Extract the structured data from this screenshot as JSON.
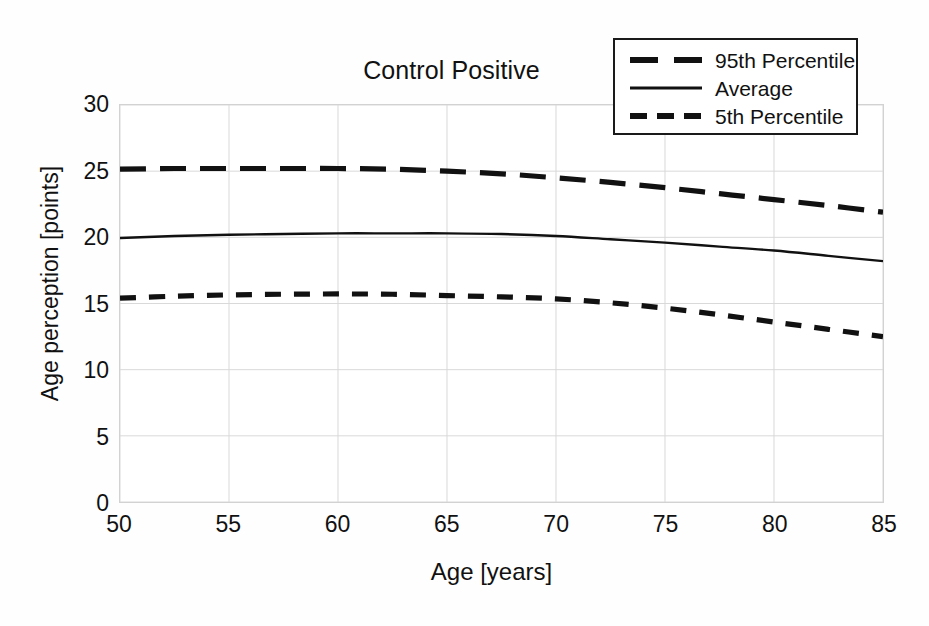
{
  "chart_data": {
    "type": "line",
    "title": "Control Positive",
    "xlabel": "Age [years]",
    "ylabel": "Age perception [points]",
    "xlim": [
      50,
      85
    ],
    "ylim": [
      0,
      30
    ],
    "xticks": [
      50,
      55,
      60,
      65,
      70,
      75,
      80,
      85
    ],
    "yticks": [
      0,
      5,
      10,
      15,
      20,
      25,
      30
    ],
    "grid": true,
    "legend_position": "top-right",
    "x": [
      50,
      52.5,
      55,
      57.5,
      60,
      62.5,
      65,
      67.5,
      70,
      72.5,
      75,
      77.5,
      80,
      82.5,
      85
    ],
    "series": [
      {
        "name": "95th Percentile",
        "style": "long-dash",
        "color": "#111111",
        "values": [
          25.15,
          25.2,
          25.2,
          25.2,
          25.2,
          25.15,
          25.0,
          24.8,
          24.5,
          24.15,
          23.75,
          23.3,
          22.85,
          22.4,
          21.9
        ]
      },
      {
        "name": "Average",
        "style": "solid",
        "color": "#111111",
        "values": [
          19.95,
          20.1,
          20.2,
          20.25,
          20.3,
          20.3,
          20.3,
          20.25,
          20.1,
          19.85,
          19.6,
          19.3,
          19.0,
          18.6,
          18.2
        ]
      },
      {
        "name": "5th Percentile",
        "style": "short-dash",
        "color": "#111111",
        "values": [
          15.4,
          15.55,
          15.65,
          15.7,
          15.72,
          15.7,
          15.6,
          15.5,
          15.35,
          15.05,
          14.65,
          14.15,
          13.6,
          13.05,
          12.5
        ]
      }
    ]
  },
  "legend": {
    "items": [
      {
        "label": "95th Percentile",
        "swatch": "long-dash-swatch"
      },
      {
        "label": "Average",
        "swatch": "solid-line-swatch"
      },
      {
        "label": "5th Percentile",
        "swatch": "short-dash-swatch"
      }
    ]
  },
  "colors": {
    "line": "#111111",
    "grid": "#d9d9d9",
    "frame": "#d2d2d2",
    "background": "#ffffff"
  }
}
